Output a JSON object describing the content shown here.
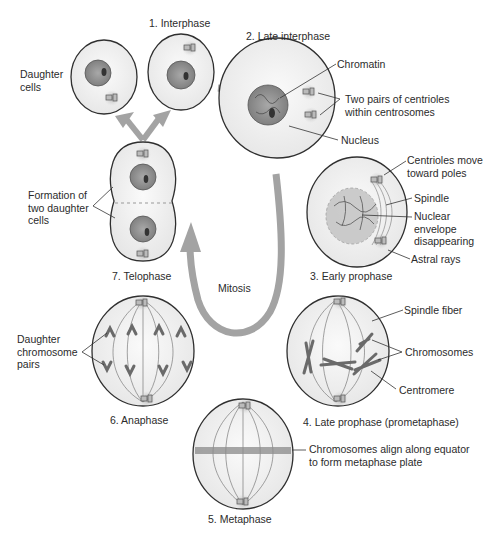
{
  "diagram": {
    "cycle_label": "Mitosis",
    "colors": {
      "background": "#ffffff",
      "arrow": "#a3a3a3",
      "cell_fill": "#f0f0f0",
      "cell_outline": "#2f2f2f",
      "nucleus": "#8c8c8c",
      "text": "#2b2b2b"
    },
    "stages": [
      {
        "id": 1,
        "label": "1. Interphase"
      },
      {
        "id": 2,
        "label": "2. Late interphase"
      },
      {
        "id": 3,
        "label": "3. Early prophase"
      },
      {
        "id": 4,
        "label": "4. Late prophase (prometaphase)"
      },
      {
        "id": 5,
        "label": "5. Metaphase"
      },
      {
        "id": 6,
        "label": "6. Anaphase"
      },
      {
        "id": 7,
        "label": "7. Telophase"
      }
    ],
    "annotations": {
      "daughter_cells": "Daughter cells",
      "chromatin": "Chromatin",
      "centriole_pairs": "Two pairs of centrioles within centrosomes",
      "nucleus": "Nucleus",
      "centrioles_move": "Centrioles move toward poles",
      "spindle": "Spindle",
      "nuclear_envelope": "Nuclear envelope disappearing",
      "astral_rays": "Astral rays",
      "spindle_fiber": "Spindle fiber",
      "chromosomes": "Chromosomes",
      "centromere": "Centromere",
      "metaphase_plate": "Chromosomes align along equator to form metaphase plate",
      "daughter_pairs": "Daughter chromosome pairs",
      "formation_daughter": "Formation of two daughter cells"
    }
  }
}
